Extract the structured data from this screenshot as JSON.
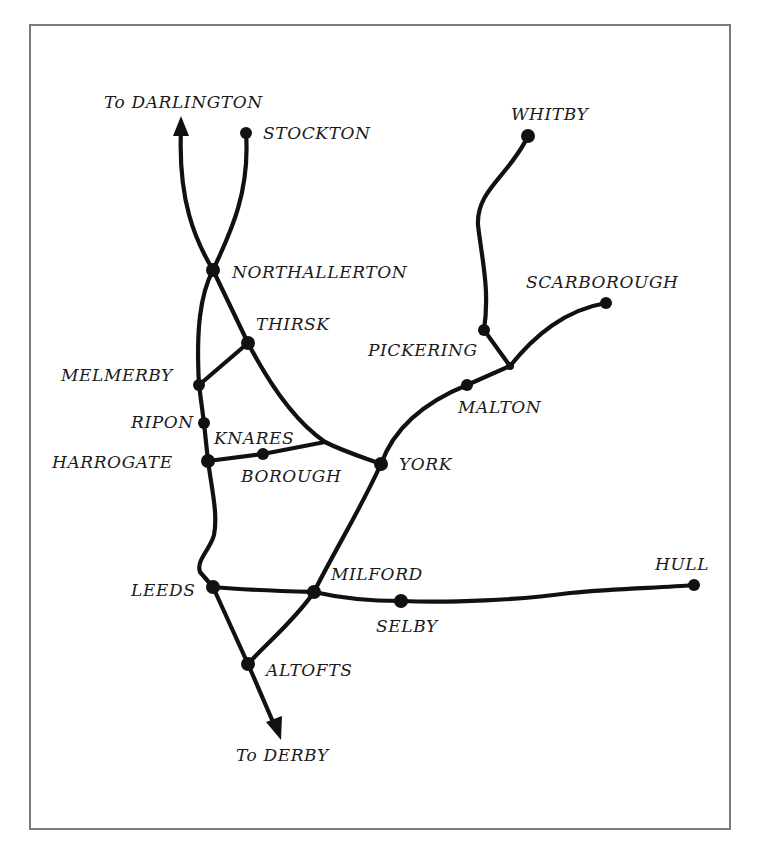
{
  "map": {
    "title": "",
    "colors": {
      "line": "#111111",
      "frame": "#7a7a7a",
      "background": "#ffffff"
    },
    "labels": {
      "darlington": "To DARLINGTON",
      "stockton": "STOCKTON",
      "northallerton": "NORTHALLERTON",
      "thirsk": "THIRSK",
      "melmerby": "MELMERBY",
      "ripon": "RIPON",
      "knares": "KNARES",
      "borough": "BOROUGH",
      "harrogate": "HARROGATE",
      "york": "YORK",
      "whitby": "WHITBY",
      "scarborough": "SCARBOROUGH",
      "pickering": "PICKERING",
      "malton": "MALTON",
      "leeds": "LEEDS",
      "milford": "MILFORD",
      "selby": "SELBY",
      "hull": "HULL",
      "altofts": "ALTOFTS",
      "derby": "To DERBY"
    },
    "stations": [
      {
        "name": "Stockton",
        "x": 246,
        "y": 133
      },
      {
        "name": "Northallerton",
        "x": 213,
        "y": 270
      },
      {
        "name": "Thirsk",
        "x": 248,
        "y": 343
      },
      {
        "name": "Melmerby",
        "x": 199,
        "y": 385
      },
      {
        "name": "Ripon",
        "x": 204,
        "y": 423
      },
      {
        "name": "Harrogate",
        "x": 208,
        "y": 461
      },
      {
        "name": "Knaresborough",
        "x": 263,
        "y": 454
      },
      {
        "name": "York",
        "x": 381,
        "y": 464
      },
      {
        "name": "Malton",
        "x": 467,
        "y": 385
      },
      {
        "name": "Pickering",
        "x": 484,
        "y": 330
      },
      {
        "name": "Whitby",
        "x": 528,
        "y": 136
      },
      {
        "name": "Scarborough",
        "x": 606,
        "y": 303
      },
      {
        "name": "Leeds",
        "x": 213,
        "y": 587
      },
      {
        "name": "Milford",
        "x": 314,
        "y": 592
      },
      {
        "name": "Selby",
        "x": 401,
        "y": 601
      },
      {
        "name": "Hull",
        "x": 694,
        "y": 585
      },
      {
        "name": "Altofts",
        "x": 248,
        "y": 664
      }
    ],
    "arrows": [
      {
        "to": "Darlington",
        "direction": "north"
      },
      {
        "to": "Derby",
        "direction": "south"
      }
    ]
  }
}
